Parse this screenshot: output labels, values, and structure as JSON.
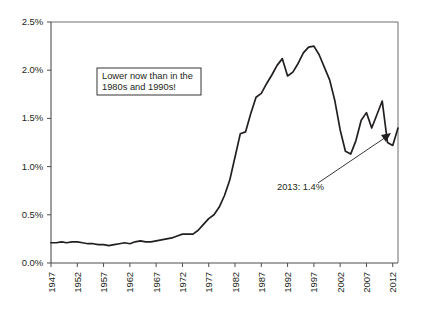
{
  "chart_data": {
    "type": "line",
    "title": "",
    "subtitle": "",
    "xlabel": "",
    "ylabel": "",
    "xlim": [
      1947,
      2013
    ],
    "ylim": [
      0.0,
      2.5
    ],
    "grid": false,
    "legend": false,
    "y_tick_labels": [
      "0.0%",
      "0.5%",
      "1.0%",
      "1.5%",
      "2.0%",
      "2.5%"
    ],
    "y_tick_values": [
      0.0,
      0.5,
      1.0,
      1.5,
      2.0,
      2.5
    ],
    "x_tick_labels": [
      "1947",
      "1952",
      "1957",
      "1962",
      "1967",
      "1972",
      "1977",
      "1982",
      "1987",
      "1992",
      "1997",
      "2002",
      "2007",
      "2012"
    ],
    "x_tick_values": [
      1947,
      1952,
      1957,
      1962,
      1967,
      1972,
      1977,
      1982,
      1987,
      1992,
      1997,
      2002,
      2007,
      2012
    ],
    "series": [
      {
        "name": "series-1",
        "color": "#231f20",
        "x": [
          1947,
          1948,
          1949,
          1950,
          1951,
          1952,
          1953,
          1954,
          1955,
          1956,
          1957,
          1958,
          1959,
          1960,
          1961,
          1962,
          1963,
          1964,
          1965,
          1966,
          1967,
          1968,
          1969,
          1970,
          1971,
          1972,
          1973,
          1974,
          1975,
          1976,
          1977,
          1978,
          1979,
          1980,
          1981,
          1982,
          1983,
          1984,
          1985,
          1986,
          1987,
          1988,
          1989,
          1990,
          1991,
          1992,
          1993,
          1994,
          1995,
          1996,
          1997,
          1998,
          1999,
          2000,
          2001,
          2002,
          2003,
          2004,
          2005,
          2006,
          2007,
          2008,
          2009,
          2010,
          2011,
          2012,
          2013
        ],
        "y": [
          0.21,
          0.21,
          0.22,
          0.21,
          0.22,
          0.22,
          0.21,
          0.2,
          0.2,
          0.19,
          0.19,
          0.18,
          0.19,
          0.2,
          0.21,
          0.2,
          0.22,
          0.23,
          0.22,
          0.22,
          0.23,
          0.24,
          0.25,
          0.26,
          0.28,
          0.3,
          0.3,
          0.3,
          0.34,
          0.4,
          0.46,
          0.5,
          0.58,
          0.7,
          0.86,
          1.1,
          1.34,
          1.36,
          1.55,
          1.72,
          1.76,
          1.86,
          1.95,
          2.05,
          2.12,
          1.94,
          1.98,
          2.07,
          2.18,
          2.24,
          2.25,
          2.16,
          2.03,
          1.9,
          1.68,
          1.38,
          1.16,
          1.13,
          1.27,
          1.48,
          1.56,
          1.4,
          1.54,
          1.68,
          1.25,
          1.22,
          1.4
        ]
      }
    ],
    "annotations": [
      {
        "id": "callout-box",
        "lines": [
          "Lower now than in the",
          "1980s and 1990s!"
        ],
        "boxed": true
      },
      {
        "id": "end-label",
        "text": "2013: 1.4%",
        "boxed": false,
        "arrow": true
      }
    ]
  }
}
